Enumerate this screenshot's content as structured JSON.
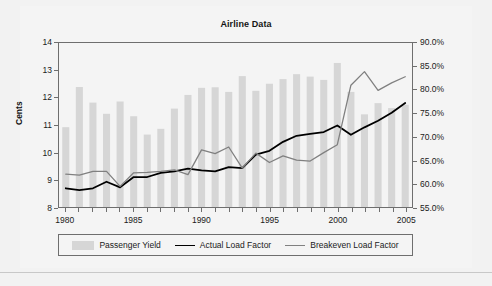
{
  "chart_data": {
    "type": "bar",
    "title": "Airline Data",
    "xlabel": "",
    "ylabel": "Cents",
    "y2label": "",
    "x": [
      1980,
      1981,
      1982,
      1983,
      1984,
      1985,
      1986,
      1987,
      1988,
      1989,
      1990,
      1991,
      1992,
      1993,
      1994,
      1995,
      1996,
      1997,
      1998,
      1999,
      2000,
      2001,
      2002,
      2003,
      2004,
      2005
    ],
    "xlim": [
      1979.5,
      2005.5
    ],
    "xticks": [
      1980,
      1981,
      1982,
      1983,
      1984,
      1985,
      1986,
      1987,
      1988,
      1989,
      1990,
      1991,
      1992,
      1993,
      1994,
      1995,
      1996,
      1997,
      1998,
      1999,
      2000,
      2001,
      2002,
      2003,
      2004,
      2005
    ],
    "xticklabels": [
      "1980",
      "1985",
      "1990",
      "1995",
      "2000",
      "2005"
    ],
    "xticklabel_years": [
      1980,
      1985,
      1990,
      1995,
      2000,
      2005
    ],
    "ylim": [
      8,
      14
    ],
    "yticks": [
      8,
      9,
      10,
      11,
      12,
      13,
      14
    ],
    "yticklabels": [
      "8",
      "9",
      "10",
      "11",
      "12",
      "13",
      "14"
    ],
    "y2lim": [
      55.0,
      90.0
    ],
    "y2ticks": [
      55.0,
      60.0,
      65.0,
      70.0,
      75.0,
      80.0,
      85.0,
      90.0
    ],
    "y2ticklabels": [
      "55.0%",
      "60.0%",
      "65.0%",
      "70.0%",
      "75.0%",
      "80.0%",
      "85.0%",
      "90.0%"
    ],
    "grid": false,
    "legend_position": "bottom",
    "series": [
      {
        "name": "Passenger Yield",
        "type": "bar",
        "axis": "left",
        "unit": "cents",
        "color": "#d6d6d6",
        "values": [
          10.92,
          12.39,
          11.82,
          11.41,
          11.86,
          11.32,
          10.65,
          10.86,
          11.6,
          12.1,
          12.36,
          12.38,
          12.21,
          12.79,
          12.25,
          12.51,
          12.68,
          12.86,
          12.77,
          12.65,
          13.27,
          12.21,
          11.39,
          11.8,
          11.62,
          11.74
        ]
      },
      {
        "name": "Actual Load Factor",
        "type": "line",
        "axis": "right",
        "unit": "percent",
        "color": "#000000",
        "values": [
          59.0,
          58.6,
          59.0,
          60.4,
          59.2,
          61.4,
          61.4,
          62.3,
          62.6,
          63.2,
          62.8,
          62.6,
          63.5,
          63.3,
          66.2,
          67.0,
          68.9,
          70.2,
          70.6,
          71.0,
          72.4,
          70.4,
          72.0,
          73.4,
          75.1,
          77.2
        ]
      },
      {
        "name": "Breakeven Load Factor",
        "type": "line",
        "axis": "right",
        "unit": "percent",
        "color": "#808080",
        "values": [
          62.0,
          61.8,
          62.6,
          62.6,
          59.4,
          62.3,
          62.4,
          62.6,
          62.9,
          61.9,
          67.2,
          66.4,
          67.8,
          63.3,
          66.5,
          64.5,
          65.9,
          65.0,
          64.8,
          66.6,
          68.3,
          81.0,
          83.9,
          79.9,
          81.5,
          82.8
        ]
      }
    ]
  },
  "legend": {
    "items": [
      {
        "label": "Passenger Yield",
        "marker": "bar-swatch"
      },
      {
        "label": "Actual Load Factor",
        "marker": "line-swatch-black"
      },
      {
        "label": "Breakeven Load Factor",
        "marker": "line-swatch-gray"
      }
    ]
  },
  "colors": {
    "bar": "#d6d6d6",
    "actual_load_factor": "#000000",
    "breakeven_load_factor": "#808080",
    "frame": "#6e6e6e",
    "background": "#f2f2f2",
    "plot_background": "#f4f4f4"
  }
}
